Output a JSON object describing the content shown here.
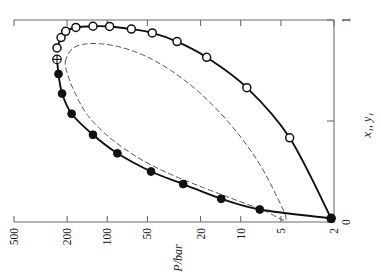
{
  "chart_data": {
    "type": "line",
    "title": "",
    "xlabel": "P/bar",
    "ylabel": "x₁, y₁",
    "xscale": "log-reversed",
    "xlim": [
      600,
      1.75
    ],
    "ylim": [
      0,
      1
    ],
    "grid": false,
    "legend_position": "none",
    "x_tick_labels": [
      "500",
      "200",
      "100",
      "50",
      "20",
      "10",
      "5",
      "2"
    ],
    "x_tick_values": [
      500,
      200,
      100,
      50,
      20,
      10,
      5,
      2
    ],
    "y_tick_labels": [
      "1",
      "",
      "0"
    ],
    "y_tick_values": [
      1,
      0.5,
      0
    ],
    "annotations": [
      {
        "name": "critical-point",
        "marker": "circle-plus",
        "P": 238,
        "y": 0.805
      }
    ],
    "series": [
      {
        "name": "vapour-branch",
        "marker": "open-circle",
        "linestyle": "solid",
        "points": [
          {
            "P": 238,
            "y": 0.862
          },
          {
            "P": 222,
            "y": 0.913
          },
          {
            "P": 205,
            "y": 0.944
          },
          {
            "P": 172,
            "y": 0.963
          },
          {
            "P": 128,
            "y": 0.969
          },
          {
            "P": 96,
            "y": 0.968
          },
          {
            "P": 66,
            "y": 0.955
          },
          {
            "P": 46,
            "y": 0.936
          },
          {
            "P": 30,
            "y": 0.893
          },
          {
            "P": 18,
            "y": 0.815
          },
          {
            "P": 9.0,
            "y": 0.665
          },
          {
            "P": 4.3,
            "y": 0.417
          },
          {
            "P": 2.1,
            "y": 0.018
          }
        ]
      },
      {
        "name": "liquid-branch",
        "marker": "filled-circle",
        "linestyle": "solid",
        "points": [
          {
            "P": 238,
            "y": 0.805
          },
          {
            "P": 232,
            "y": 0.733
          },
          {
            "P": 218,
            "y": 0.636
          },
          {
            "P": 185,
            "y": 0.536
          },
          {
            "P": 128,
            "y": 0.432
          },
          {
            "P": 84,
            "y": 0.34
          },
          {
            "P": 47,
            "y": 0.25
          },
          {
            "P": 27,
            "y": 0.188
          },
          {
            "P": 14,
            "y": 0.115
          },
          {
            "P": 7.2,
            "y": 0.062
          },
          {
            "P": 2.1,
            "y": 0.018
          }
        ]
      },
      {
        "name": "calculated-envelope",
        "marker": "none",
        "linestyle": "dashed",
        "points": [
          {
            "P": 206,
            "y": 0.795
          },
          {
            "P": 184,
            "y": 0.856
          },
          {
            "P": 150,
            "y": 0.88
          },
          {
            "P": 112,
            "y": 0.882
          },
          {
            "P": 78,
            "y": 0.864
          },
          {
            "P": 52,
            "y": 0.822
          },
          {
            "P": 33,
            "y": 0.748
          },
          {
            "P": 20,
            "y": 0.636
          },
          {
            "P": 12,
            "y": 0.485
          },
          {
            "P": 7.6,
            "y": 0.31
          },
          {
            "P": 5.4,
            "y": 0.13
          },
          {
            "P": 4.6,
            "y": 0.01
          },
          {
            "P": 6.6,
            "y": 0.055
          },
          {
            "P": 11,
            "y": 0.11
          },
          {
            "P": 19,
            "y": 0.17
          },
          {
            "P": 34,
            "y": 0.238
          },
          {
            "P": 58,
            "y": 0.316
          },
          {
            "P": 96,
            "y": 0.418
          },
          {
            "P": 140,
            "y": 0.528
          },
          {
            "P": 175,
            "y": 0.64
          },
          {
            "P": 198,
            "y": 0.73
          },
          {
            "P": 206,
            "y": 0.795
          }
        ]
      }
    ]
  },
  "axes": {
    "x_axis_label": "P/bar",
    "y_axis_label": "x₁, y₁"
  },
  "ticks": {
    "x": [
      {
        "label": "500",
        "value": 500
      },
      {
        "label": "200",
        "value": 200
      },
      {
        "label": "100",
        "value": 100
      },
      {
        "label": "50",
        "value": 50
      },
      {
        "label": "20",
        "value": 20
      },
      {
        "label": "10",
        "value": 10
      },
      {
        "label": "5",
        "value": 5
      },
      {
        "label": "2",
        "value": 2
      }
    ],
    "y": [
      {
        "label": "1",
        "value": 1
      },
      {
        "label": "",
        "value": 0.5
      },
      {
        "label": "0",
        "value": 0
      }
    ]
  },
  "style": {
    "line_color": "#111111",
    "dash_color": "#555555",
    "axis_color": "#6b6b6b",
    "marker_fill_open": "#ffffff",
    "marker_fill_closed": "#111111"
  }
}
